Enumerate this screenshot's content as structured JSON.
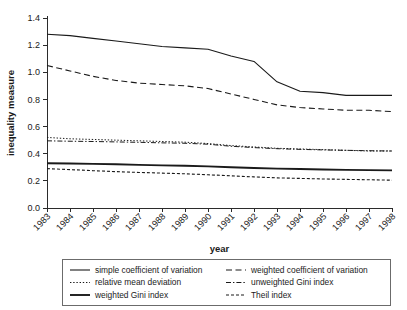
{
  "chart_data": {
    "type": "line",
    "title": "",
    "xlabel": "year",
    "ylabel": "inequality measure",
    "grid": false,
    "legend_position": "bottom",
    "xlim": [
      1983,
      1998
    ],
    "ylim": [
      0.0,
      1.4
    ],
    "ytick_labels": [
      "0.0",
      "0.2",
      "0.4",
      "0.6",
      "0.8",
      "1.0",
      "1.2",
      "1.4"
    ],
    "ytick_values": [
      0.0,
      0.2,
      0.4,
      0.6,
      0.8,
      1.0,
      1.2,
      1.4
    ],
    "categories": [
      "1983",
      "1984",
      "1985",
      "1986",
      "1987",
      "1988",
      "1989",
      "1990",
      "1991",
      "1992",
      "1993",
      "1994",
      "1995",
      "1996",
      "1997",
      "1998"
    ],
    "x": [
      1983,
      1984,
      1985,
      1986,
      1987,
      1988,
      1989,
      1990,
      1991,
      1992,
      1993,
      1994,
      1995,
      1996,
      1997,
      1998
    ],
    "series": [
      {
        "name": "simple coefficient of variation",
        "style": "solid",
        "values": [
          1.28,
          1.27,
          1.25,
          1.23,
          1.21,
          1.19,
          1.18,
          1.17,
          1.12,
          1.08,
          0.93,
          0.86,
          0.85,
          0.83,
          0.83,
          0.83
        ]
      },
      {
        "name": "weighted coefficient of variation",
        "style": "dashed",
        "values": [
          1.05,
          1.01,
          0.97,
          0.94,
          0.92,
          0.91,
          0.9,
          0.88,
          0.84,
          0.8,
          0.76,
          0.74,
          0.73,
          0.72,
          0.72,
          0.71
        ]
      },
      {
        "name": "relative mean deviation",
        "style": "dotted",
        "values": [
          0.52,
          0.51,
          0.505,
          0.5,
          0.495,
          0.49,
          0.485,
          0.475,
          0.46,
          0.45,
          0.44,
          0.435,
          0.43,
          0.425,
          0.42,
          0.42
        ]
      },
      {
        "name": "unweighted Gini index",
        "style": "dashdot",
        "values": [
          0.495,
          0.492,
          0.49,
          0.487,
          0.484,
          0.48,
          0.477,
          0.47,
          0.455,
          0.445,
          0.437,
          0.432,
          0.428,
          0.425,
          0.422,
          0.42
        ]
      },
      {
        "name": "weighted Gini index",
        "style": "thick-solid",
        "values": [
          0.33,
          0.328,
          0.325,
          0.322,
          0.318,
          0.314,
          0.311,
          0.307,
          0.3,
          0.295,
          0.29,
          0.287,
          0.284,
          0.281,
          0.279,
          0.277
        ]
      },
      {
        "name": "Theil index",
        "style": "densely-dashed",
        "values": [
          0.29,
          0.283,
          0.275,
          0.268,
          0.262,
          0.257,
          0.252,
          0.245,
          0.237,
          0.229,
          0.222,
          0.218,
          0.214,
          0.211,
          0.208,
          0.205
        ]
      }
    ]
  },
  "legend": {
    "entries": [
      {
        "label": "simple coefficient of variation",
        "style": "solid"
      },
      {
        "label": "weighted coefficient of variation",
        "style": "dashed"
      },
      {
        "label": "relative mean deviation",
        "style": "dotted"
      },
      {
        "label": "unweighted Gini index",
        "style": "dashdot"
      },
      {
        "label": "weighted Gini index",
        "style": "thick-solid"
      },
      {
        "label": "Theil index",
        "style": "densely-dashed"
      }
    ]
  },
  "colors": {
    "ink": "#1a1a1a",
    "axis": "#2b2b2b",
    "legend_border": "#6b6b6b",
    "background": "#ffffff"
  }
}
